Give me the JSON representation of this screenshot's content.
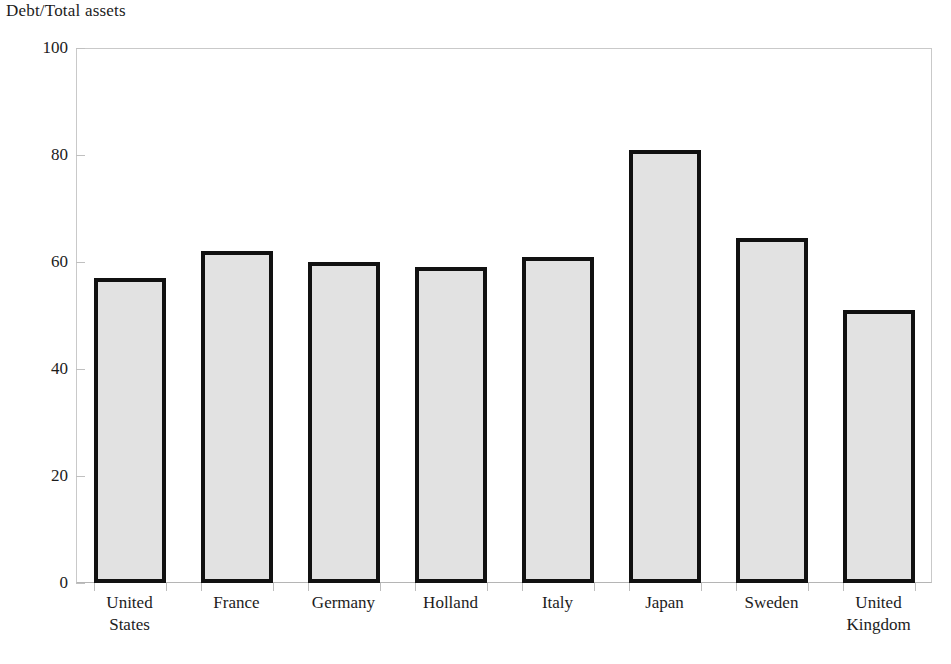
{
  "chart_data": {
    "type": "bar",
    "title": "Debt/Total assets",
    "xlabel": "",
    "ylabel": "",
    "ylim": [
      0,
      100
    ],
    "yticks": [
      0,
      20,
      40,
      60,
      80,
      100
    ],
    "ytick_labels": [
      "0",
      "20",
      "40",
      "60",
      "80",
      "100"
    ],
    "grid": false,
    "legend": null,
    "categories": [
      "United\nStates",
      "France",
      "Germany",
      "Holland",
      "Italy",
      "Japan",
      "Sweden",
      "United\nKingdom"
    ],
    "values": [
      57,
      62,
      60,
      59,
      61,
      81,
      64.5,
      51
    ],
    "series": [
      {
        "name": "Debt/Total assets",
        "values": [
          57,
          62,
          60,
          59,
          61,
          81,
          64.5,
          51
        ]
      }
    ],
    "bar_fill_color": "#e2e2e2",
    "bar_edge_color": "#111111",
    "axis_color": "#c0c0c0",
    "text_color": "#1c1c1c",
    "background_color": "#ffffff"
  }
}
